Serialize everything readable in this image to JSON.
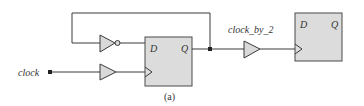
{
  "diagram": {
    "type": "circuit",
    "caption": "(a)",
    "signals": {
      "input": "clock",
      "output": "clock_by_2"
    },
    "flipflops": [
      {
        "id": "ff1",
        "d_label": "D",
        "q_label": "Q"
      },
      {
        "id": "ff2",
        "d_label": "D",
        "q_label": "Q"
      }
    ],
    "gates": [
      {
        "id": "inv1",
        "kind": "inverter"
      },
      {
        "id": "buf1",
        "kind": "buffer"
      },
      {
        "id": "buf2",
        "kind": "buffer"
      }
    ],
    "colors": {
      "wire": "#3a3a3a",
      "fill": "#dcdcdc"
    }
  }
}
